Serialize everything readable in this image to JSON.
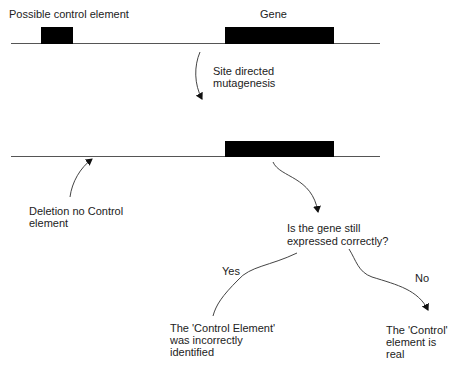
{
  "diagram": {
    "top_row": {
      "control_label": "Possible control element",
      "gene_label": "Gene"
    },
    "step_label_1": "Site directed",
    "step_label_2": "mutagenesis",
    "bottom_row": {
      "deletion_label_1": "Deletion no Control",
      "deletion_label_2": "element"
    },
    "question_1": "Is the gene still",
    "question_2": "expressed correctly?",
    "yes_label": "Yes",
    "no_label": "No",
    "yes_outcome_1": "The 'Control Element'",
    "yes_outcome_2": "was incorrectly",
    "yes_outcome_3": "identified",
    "no_outcome_1": "The 'Control'",
    "no_outcome_2": "element is",
    "no_outcome_3": "real",
    "colors": {
      "line": "#555555",
      "block": "#000000",
      "text": "#222222",
      "background": "#ffffff"
    }
  }
}
